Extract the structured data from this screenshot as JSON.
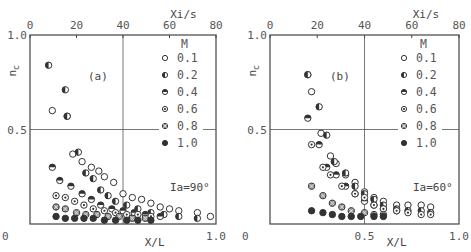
{
  "chart_data": [
    {
      "type": "scatter",
      "panel_label": "(a)",
      "annotation": "Ia=90°",
      "xlabel": "X/L",
      "x2label": "Xi/s",
      "ylabel": "n_c",
      "xlim": [
        0,
        1.0
      ],
      "x2lim": [
        0,
        80
      ],
      "ylim": [
        0,
        1.0
      ],
      "x_ticks": [
        "0",
        "1.0"
      ],
      "x2_ticks": [
        "0",
        "20",
        "40",
        "60",
        "80"
      ],
      "y_ticks": [
        "0",
        "0.5",
        "1.0"
      ],
      "grid": "crosshair at X/L=0.5 and n_c=0.5",
      "legend_title": "M",
      "legend_position": "upper right",
      "series": [
        {
          "name": "0.1",
          "marker": "open",
          "x": [
            0.12,
            0.2,
            0.23,
            0.28,
            0.33,
            0.37,
            0.4,
            0.45,
            0.5,
            0.55,
            0.6,
            0.65,
            0.7,
            0.75,
            0.8,
            0.9,
            0.97
          ],
          "y": [
            0.6,
            0.57,
            0.37,
            0.33,
            0.3,
            0.28,
            0.25,
            0.22,
            0.16,
            0.14,
            0.13,
            0.11,
            0.09,
            0.08,
            0.07,
            0.06,
            0.04
          ]
        },
        {
          "name": "0.2",
          "marker": "half-left",
          "x": [
            0.1,
            0.19,
            0.2,
            0.26,
            0.3,
            0.34,
            0.38,
            0.42,
            0.46,
            0.52,
            0.58,
            0.65,
            0.72,
            0.8,
            0.9
          ],
          "y": [
            0.84,
            0.71,
            0.57,
            0.38,
            0.27,
            0.24,
            0.18,
            0.15,
            0.12,
            0.1,
            0.08,
            0.06,
            0.05,
            0.04,
            0.03
          ]
        },
        {
          "name": "0.4",
          "marker": "half-top",
          "x": [
            0.12,
            0.16,
            0.22,
            0.28,
            0.33,
            0.38,
            0.44,
            0.5,
            0.56,
            0.62,
            0.7
          ],
          "y": [
            0.3,
            0.23,
            0.2,
            0.16,
            0.13,
            0.1,
            0.08,
            0.07,
            0.06,
            0.05,
            0.04
          ]
        },
        {
          "name": "0.6",
          "marker": "dot-center",
          "x": [
            0.14,
            0.19,
            0.24,
            0.29,
            0.34,
            0.4,
            0.46,
            0.52,
            0.58,
            0.65
          ],
          "y": [
            0.15,
            0.14,
            0.12,
            0.1,
            0.08,
            0.07,
            0.06,
            0.05,
            0.05,
            0.04
          ]
        },
        {
          "name": "0.8",
          "marker": "hatched",
          "x": [
            0.14,
            0.19,
            0.25,
            0.3,
            0.36,
            0.42,
            0.48,
            0.55,
            0.62
          ],
          "y": [
            0.09,
            0.08,
            0.06,
            0.05,
            0.05,
            0.04,
            0.04,
            0.03,
            0.03
          ]
        },
        {
          "name": "1.0",
          "marker": "filled",
          "x": [
            0.14,
            0.19,
            0.24,
            0.29,
            0.34,
            0.4,
            0.46,
            0.52,
            0.58,
            0.65
          ],
          "y": [
            0.04,
            0.03,
            0.03,
            0.03,
            0.03,
            0.02,
            0.02,
            0.02,
            0.02,
            0.02
          ]
        }
      ]
    },
    {
      "type": "scatter",
      "panel_label": "(b)",
      "annotation": "Ia=60°",
      "xlabel": "X/L",
      "x2label": "Xi/s",
      "ylabel": "n_c",
      "xlim": [
        0,
        1.0
      ],
      "x2lim": [
        0,
        80
      ],
      "ylim": [
        0,
        1.0
      ],
      "x_ticks": [
        "0",
        "0.5",
        "1.0"
      ],
      "x2_ticks": [
        "0",
        "20",
        "40",
        "60",
        "80"
      ],
      "y_ticks": [
        "0",
        "0.5",
        "1.0"
      ],
      "grid": "crosshair at X/L=0.5 and n_c=0.5",
      "legend_title": "M",
      "legend_position": "upper right",
      "series": [
        {
          "name": "0.1",
          "marker": "open",
          "x": [
            0.2,
            0.22,
            0.27,
            0.32,
            0.35,
            0.4,
            0.45,
            0.5,
            0.55,
            0.6,
            0.67,
            0.73,
            0.8,
            0.85
          ],
          "y": [
            0.79,
            0.7,
            0.48,
            0.36,
            0.32,
            0.26,
            0.22,
            0.17,
            0.14,
            0.12,
            0.1,
            0.1,
            0.1,
            0.09
          ]
        },
        {
          "name": "0.2",
          "marker": "half-left",
          "x": [
            0.2,
            0.26,
            0.3,
            0.34,
            0.4,
            0.45,
            0.5,
            0.55,
            0.6,
            0.67,
            0.73,
            0.8,
            0.85
          ],
          "y": [
            0.79,
            0.62,
            0.47,
            0.33,
            0.27,
            0.2,
            0.16,
            0.13,
            0.1,
            0.08,
            0.07,
            0.07,
            0.06
          ]
        },
        {
          "name": "0.4",
          "marker": "half-top",
          "x": [
            0.2,
            0.26,
            0.3,
            0.35,
            0.4,
            0.45,
            0.5,
            0.55,
            0.6,
            0.67
          ],
          "y": [
            0.56,
            0.42,
            0.3,
            0.26,
            0.2,
            0.16,
            0.12,
            0.1,
            0.08,
            0.07
          ]
        },
        {
          "name": "0.6",
          "marker": "dot-center",
          "x": [
            0.22,
            0.28,
            0.32,
            0.38,
            0.45,
            0.5,
            0.55,
            0.6,
            0.67,
            0.73,
            0.8,
            0.85
          ],
          "y": [
            0.42,
            0.3,
            0.26,
            0.2,
            0.16,
            0.14,
            0.1,
            0.08,
            0.07,
            0.06,
            0.05,
            0.05
          ]
        },
        {
          "name": "0.8",
          "marker": "hatched",
          "x": [
            0.22,
            0.28,
            0.33,
            0.38,
            0.43,
            0.5,
            0.55,
            0.6
          ],
          "y": [
            0.2,
            0.15,
            0.11,
            0.09,
            0.07,
            0.06,
            0.05,
            0.05
          ]
        },
        {
          "name": "1.0",
          "marker": "filled",
          "x": [
            0.22,
            0.28,
            0.33,
            0.38,
            0.43,
            0.48,
            0.55,
            0.6
          ],
          "y": [
            0.07,
            0.06,
            0.05,
            0.04,
            0.04,
            0.04,
            0.04,
            0.04
          ]
        }
      ]
    }
  ],
  "labels": {
    "a_panel": "(a)",
    "a_annot": "Ia=90°",
    "b_panel": "(b)",
    "b_annot": "Ia=60°",
    "xlabel": "X/L",
    "x2label": "Xi/s",
    "ylabel": "n",
    "ylabel_sub": "c",
    "legend_title": "M"
  }
}
